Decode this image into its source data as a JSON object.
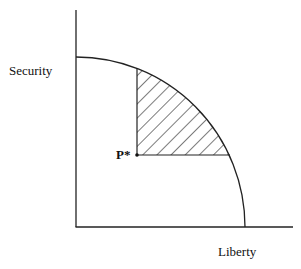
{
  "diagram": {
    "y_axis_label": "Security",
    "x_axis_label": "Liberty",
    "point_label": "P*",
    "curve": "concave frontier from Security axis to Liberty axis",
    "shaded_region": "hatched area above and to the right of P* bounded by the frontier",
    "colors": {
      "line": "#222222",
      "background": "#ffffff"
    }
  }
}
